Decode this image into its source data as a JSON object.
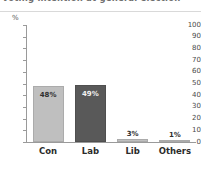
{
  "figure": {
    "clipped_title": "Voting intention at general election",
    "unit_label": "%"
  },
  "chart_data": {
    "type": "bar",
    "title": "",
    "xlabel": "",
    "ylabel": "%",
    "ylim": [
      0,
      100
    ],
    "ytick_step": 10,
    "grid": false,
    "legend": "none",
    "categories": [
      "Con",
      "Lab",
      "Lib",
      "Others"
    ],
    "values": [
      48,
      49,
      3,
      1
    ],
    "value_labels": [
      "48%",
      "49%",
      "3%",
      "1%"
    ],
    "bar_colors": [
      "#bfbfbf",
      "#595959",
      "#bfbfbf",
      "#bfbfbf"
    ],
    "label_placement": [
      "inside",
      "inside",
      "above",
      "above"
    ],
    "ytick_labels": [
      "100",
      "90",
      "80",
      "70",
      "60",
      "50",
      "40",
      "30",
      "20",
      "10",
      "0"
    ],
    "ytick_values": [
      100,
      90,
      80,
      70,
      60,
      50,
      40,
      30,
      20,
      10,
      0
    ]
  },
  "colors": {
    "axis": "#9a9a9a",
    "rule": "#d9d9d9",
    "bar_light": "#bfbfbf",
    "bar_dark": "#595959",
    "background": "#ffffff"
  }
}
